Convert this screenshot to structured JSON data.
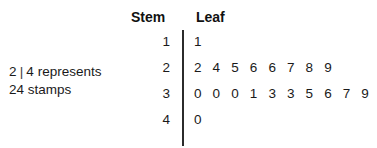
{
  "chart_data": {
    "type": "table",
    "title": "",
    "plot_kind": "stem-and-leaf",
    "columns": [
      "Stem",
      "Leaf"
    ],
    "stem_header": "Stem",
    "leaf_header": "Leaf",
    "rows": [
      {
        "stem": "1",
        "leaves": [
          "1"
        ]
      },
      {
        "stem": "2",
        "leaves": [
          "2",
          "4",
          "5",
          "6",
          "6",
          "7",
          "8",
          "9"
        ]
      },
      {
        "stem": "3",
        "leaves": [
          "0",
          "0",
          "0",
          "1",
          "3",
          "3",
          "5",
          "6",
          "7",
          "9"
        ]
      },
      {
        "stem": "4",
        "leaves": [
          "0"
        ]
      }
    ],
    "values": [
      11,
      22,
      24,
      25,
      26,
      26,
      27,
      28,
      29,
      30,
      30,
      30,
      31,
      33,
      33,
      35,
      36,
      37,
      39,
      40
    ],
    "legend": {
      "line1_stem": "2",
      "line1_separator": "|",
      "line1_leaf": "4",
      "line1_text": "represents",
      "line1": "2 | 4 represents",
      "line2": "24 stamps"
    },
    "colors": {
      "text": "#1a1a1a",
      "divider": "#2b2b2b",
      "background": "#ffffff"
    }
  }
}
